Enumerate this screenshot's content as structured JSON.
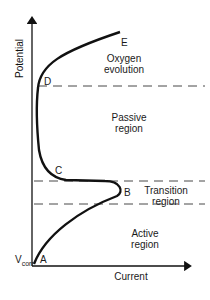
{
  "diagram": {
    "y_axis_label": "Potential",
    "x_axis_label": "Current",
    "v_corr": {
      "main": "V",
      "sub": "corr"
    },
    "points": {
      "A": "A",
      "B": "B",
      "C": "C",
      "D": "D",
      "E": "E"
    },
    "regions": {
      "oxygen": [
        "Oxygen",
        "evolution"
      ],
      "passive": [
        "Passive",
        "region"
      ],
      "transition": [
        "Transition",
        "region"
      ],
      "active": [
        "Active",
        "region"
      ]
    },
    "line_color": "#111111"
  }
}
